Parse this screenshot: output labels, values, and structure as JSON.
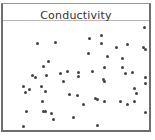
{
  "chart_data": {
    "type": "scatter",
    "title": "Conductivity",
    "xlabel": "",
    "ylabel": "",
    "grid": false,
    "legend": null,
    "points_px": [
      [
        37,
        43
      ],
      [
        55,
        42
      ],
      [
        89,
        38
      ],
      [
        101,
        35
      ],
      [
        101,
        43
      ],
      [
        144,
        27
      ],
      [
        88,
        53
      ],
      [
        116,
        47
      ],
      [
        127,
        44
      ],
      [
        143,
        47
      ],
      [
        145,
        49
      ],
      [
        107,
        56
      ],
      [
        122,
        58
      ],
      [
        48,
        61
      ],
      [
        43,
        66
      ],
      [
        104,
        67
      ],
      [
        122,
        67
      ],
      [
        32,
        75
      ],
      [
        35,
        77
      ],
      [
        46,
        75
      ],
      [
        60,
        73
      ],
      [
        67,
        71
      ],
      [
        78,
        72
      ],
      [
        78,
        76
      ],
      [
        92,
        71
      ],
      [
        103,
        79
      ],
      [
        104,
        81
      ],
      [
        125,
        73
      ],
      [
        132,
        72
      ],
      [
        145,
        77
      ],
      [
        145,
        83
      ],
      [
        23,
        86
      ],
      [
        29,
        89
      ],
      [
        25,
        92
      ],
      [
        41,
        86
      ],
      [
        45,
        91
      ],
      [
        63,
        81
      ],
      [
        69,
        94
      ],
      [
        77,
        95
      ],
      [
        134,
        88
      ],
      [
        136,
        93
      ],
      [
        42,
        101
      ],
      [
        83,
        104
      ],
      [
        95,
        98
      ],
      [
        97,
        99
      ],
      [
        104,
        101
      ],
      [
        120,
        101
      ],
      [
        127,
        104
      ],
      [
        134,
        101
      ],
      [
        26,
        111
      ],
      [
        43,
        111
      ],
      [
        45,
        111
      ],
      [
        51,
        113
      ],
      [
        53,
        119
      ],
      [
        73,
        117
      ],
      [
        145,
        112
      ],
      [
        23,
        126
      ],
      [
        97,
        125
      ]
    ]
  },
  "colors": {
    "dot": "#444444",
    "frame": "#6e6e6e",
    "title": "#333333"
  }
}
